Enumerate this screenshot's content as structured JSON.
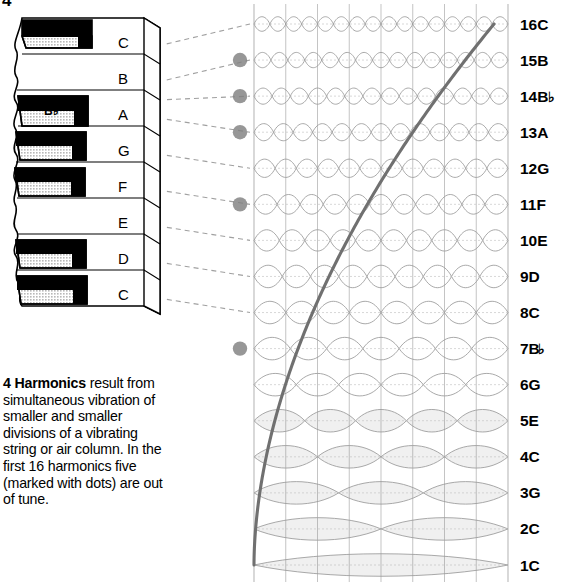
{
  "figure": {
    "number": "4",
    "caption_lead": "4 Harmonics",
    "caption_body": " result from simultaneous vibration of smaller and smaller divisions of a vibrating string or air column. In the first 16 harmonics five (marked with dots) are out of tune."
  },
  "keyboard": {
    "name": "piano-keyboard",
    "white_keys": [
      {
        "label": "C",
        "has_black_above": true
      },
      {
        "label": "B",
        "has_black_above": false
      },
      {
        "label": "A",
        "has_black_above": true
      },
      {
        "label": "G",
        "has_black_above": true
      },
      {
        "label": "F",
        "has_black_above": true
      },
      {
        "label": "E",
        "has_black_above": false
      },
      {
        "label": "D",
        "has_black_above": true
      },
      {
        "label": "C",
        "has_black_above": true
      }
    ],
    "black_key_label": "B♭"
  },
  "chart_data": {
    "type": "diagram",
    "xlabel": "",
    "ylabel": "Harmonic number / pitch",
    "grid": true,
    "legend": "",
    "annotation": "Dots mark harmonics that are out of tune",
    "out_of_tune_marker_color": "#808080",
    "curve_color": "#707070",
    "loop_color": "#999999",
    "categories": [
      "1C",
      "2C",
      "3G",
      "4C",
      "5E",
      "6G",
      "7B♭",
      "8C",
      "9D",
      "10E",
      "11F",
      "12G",
      "13A",
      "14B♭",
      "15B",
      "16C"
    ],
    "harmonics": [
      {
        "n": 1,
        "label": "1C",
        "note": "C",
        "flat": false,
        "loops": 1,
        "out_of_tune": false,
        "keyboard_link": true
      },
      {
        "n": 2,
        "label": "2C",
        "note": "C",
        "flat": false,
        "loops": 2,
        "out_of_tune": false,
        "keyboard_link": true
      },
      {
        "n": 3,
        "label": "3G",
        "note": "G",
        "flat": false,
        "loops": 3,
        "out_of_tune": false,
        "keyboard_link": true
      },
      {
        "n": 4,
        "label": "4C",
        "note": "C",
        "flat": false,
        "loops": 4,
        "out_of_tune": false,
        "keyboard_link": true
      },
      {
        "n": 5,
        "label": "5E",
        "note": "E",
        "flat": false,
        "loops": 5,
        "out_of_tune": false,
        "keyboard_link": true
      },
      {
        "n": 6,
        "label": "6G",
        "note": "G",
        "flat": false,
        "loops": 6,
        "out_of_tune": false,
        "keyboard_link": true
      },
      {
        "n": 7,
        "label": "7B",
        "note": "B",
        "flat": true,
        "loops": 7,
        "out_of_tune": true,
        "keyboard_link": true
      },
      {
        "n": 8,
        "label": "8C",
        "note": "C",
        "flat": false,
        "loops": 8,
        "out_of_tune": false,
        "keyboard_link": true
      },
      {
        "n": 9,
        "label": "9D",
        "note": "D",
        "flat": false,
        "loops": 9,
        "out_of_tune": false,
        "keyboard_link": true
      },
      {
        "n": 10,
        "label": "10E",
        "note": "E",
        "flat": false,
        "loops": 10,
        "out_of_tune": false,
        "keyboard_link": true
      },
      {
        "n": 11,
        "label": "11F",
        "note": "F",
        "flat": false,
        "loops": 11,
        "out_of_tune": true,
        "keyboard_link": true
      },
      {
        "n": 12,
        "label": "12G",
        "note": "G",
        "flat": false,
        "loops": 12,
        "out_of_tune": false,
        "keyboard_link": true
      },
      {
        "n": 13,
        "label": "13A",
        "note": "A",
        "flat": false,
        "loops": 13,
        "out_of_tune": true,
        "keyboard_link": true
      },
      {
        "n": 14,
        "label": "14B",
        "note": "B",
        "flat": true,
        "loops": 14,
        "out_of_tune": true,
        "keyboard_link": true
      },
      {
        "n": 15,
        "label": "15B",
        "note": "B",
        "flat": false,
        "loops": 15,
        "out_of_tune": true,
        "keyboard_link": true
      },
      {
        "n": 16,
        "label": "16C",
        "note": "C",
        "flat": false,
        "loops": 16,
        "out_of_tune": false,
        "keyboard_link": true
      }
    ],
    "out_of_tune_count": 5,
    "total_harmonics": 16
  }
}
